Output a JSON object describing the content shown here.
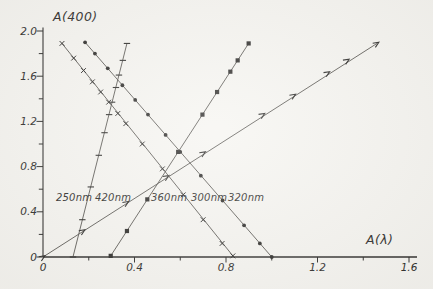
{
  "axes": {
    "ylabel": "A(400)",
    "xlabel": "A(λ)"
  },
  "series_labels": {
    "s250": "250nm",
    "s420": "420nm",
    "s360": "360nm",
    "s300": "300nm",
    "s320": "320nm"
  },
  "colors": {
    "ink": "#2b2a28",
    "line": "#514f4b",
    "paper": "#f6f5f1"
  },
  "chart_data": {
    "type": "line",
    "title": "",
    "xlabel": "A(λ)",
    "ylabel": "A(400)",
    "xlim": [
      0,
      1.635
    ],
    "ylim": [
      0,
      2.03
    ],
    "grid": false,
    "legend": "inline-labels",
    "tick_step_minor": 0.2,
    "x_ticks": [
      {
        "v": 0,
        "label": "0"
      },
      {
        "v": 0.4,
        "label": "0.4"
      },
      {
        "v": 0.8,
        "label": "0.8"
      },
      {
        "v": 1.2,
        "label": "1.2"
      },
      {
        "v": 1.6,
        "label": "1.6"
      }
    ],
    "y_ticks": [
      {
        "v": 0,
        "label": "0"
      },
      {
        "v": 0.4,
        "label": "0.4"
      },
      {
        "v": 0.8,
        "label": "0.8"
      },
      {
        "v": 1.2,
        "label": "1.2"
      },
      {
        "v": 1.6,
        "label": "1.6"
      },
      {
        "v": 2.0,
        "label": "2.0"
      }
    ],
    "series": [
      {
        "name": "250nm",
        "marker": "htick",
        "slope_sign": "positive",
        "points": [
          [
            0.131,
            0.0
          ],
          [
            0.172,
            0.33
          ],
          [
            0.209,
            0.62
          ],
          [
            0.244,
            0.9
          ],
          [
            0.269,
            1.1
          ],
          [
            0.289,
            1.26
          ],
          [
            0.302,
            1.37
          ],
          [
            0.319,
            1.5
          ],
          [
            0.332,
            1.61
          ],
          [
            0.349,
            1.74
          ],
          [
            0.367,
            1.89
          ]
        ]
      },
      {
        "name": "420nm",
        "marker": "arrow",
        "slope_sign": "positive",
        "points": [
          [
            0.0,
            0.0
          ],
          [
            0.175,
            0.23
          ],
          [
            0.366,
            0.48
          ],
          [
            0.542,
            0.71
          ],
          [
            0.702,
            0.92
          ],
          [
            0.961,
            1.26
          ],
          [
            1.096,
            1.43
          ],
          [
            1.245,
            1.63
          ],
          [
            1.33,
            1.74
          ],
          [
            1.46,
            1.89
          ]
        ]
      },
      {
        "name": "360nm",
        "marker": "square",
        "slope_sign": "positive",
        "points": [
          [
            0.296,
            0.01
          ],
          [
            0.367,
            0.23
          ],
          [
            0.456,
            0.51
          ],
          [
            0.591,
            0.93
          ],
          [
            0.697,
            1.26
          ],
          [
            0.761,
            1.46
          ],
          [
            0.819,
            1.64
          ],
          [
            0.851,
            1.74
          ],
          [
            0.899,
            1.89
          ]
        ]
      },
      {
        "name": "300nm",
        "marker": "x",
        "slope_sign": "negative",
        "points": [
          [
            0.083,
            1.89
          ],
          [
            0.134,
            1.76
          ],
          [
            0.177,
            1.65
          ],
          [
            0.216,
            1.55
          ],
          [
            0.252,
            1.46
          ],
          [
            0.287,
            1.37
          ],
          [
            0.327,
            1.27
          ],
          [
            0.362,
            1.18
          ],
          [
            0.434,
            1.0
          ],
          [
            0.522,
            0.78
          ],
          [
            0.613,
            0.55
          ],
          [
            0.7,
            0.33
          ],
          [
            0.783,
            0.12
          ],
          [
            0.83,
            0.01
          ]
        ]
      },
      {
        "name": "320nm",
        "marker": "dot",
        "slope_sign": "negative",
        "points": [
          [
            0.184,
            1.9
          ],
          [
            0.227,
            1.8
          ],
          [
            0.283,
            1.67
          ],
          [
            0.347,
            1.52
          ],
          [
            0.403,
            1.39
          ],
          [
            0.459,
            1.26
          ],
          [
            0.536,
            1.08
          ],
          [
            0.6,
            0.93
          ],
          [
            0.69,
            0.72
          ],
          [
            0.785,
            0.5
          ],
          [
            0.879,
            0.28
          ],
          [
            0.948,
            0.12
          ],
          [
            1.0,
            0.0
          ]
        ]
      }
    ]
  }
}
